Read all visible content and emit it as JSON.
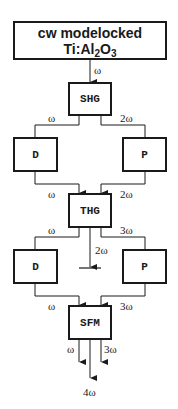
{
  "diagram": {
    "type": "block-diagram",
    "source": {
      "line1": "cw modelocked",
      "line2_prefix": "Ti:Al",
      "line2_sub1": "2",
      "line2_mid": "O",
      "line2_sub2": "3"
    },
    "stages": {
      "shg": "SHG",
      "d1": "D",
      "p1": "P",
      "thg": "THG",
      "d2": "D",
      "p2": "P",
      "sfm": "SFM"
    },
    "labels": {
      "source_to_shg": "ω",
      "shg_to_d1": "ω",
      "shg_to_p1": "2ω",
      "d1_to_thg": "ω",
      "p1_to_thg": "2ω",
      "thg_to_d2": "ω",
      "thg_to_p2": "3ω",
      "thg_dump": "2ω",
      "d2_to_sfm": "ω",
      "p2_to_sfm": "3ω",
      "sfm_out_left": "ω",
      "sfm_out_right": "3ω",
      "sfm_out_center": "4ω"
    },
    "colors": {
      "stroke": "#1a1a1a",
      "background": "#ffffff"
    }
  }
}
